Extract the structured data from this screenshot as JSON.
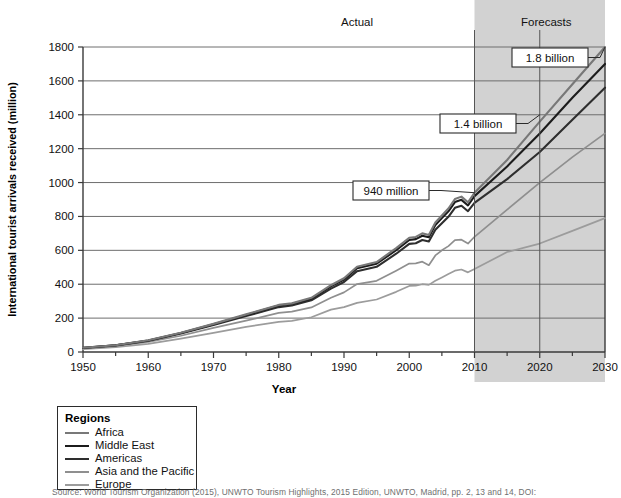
{
  "chart_data": {
    "type": "line",
    "title": "",
    "xlabel": "Year",
    "ylabel": "International tourist arrivals received (million)",
    "xlim": [
      1950,
      2030
    ],
    "ylim": [
      0,
      1800
    ],
    "grid": true,
    "legend_position": "below-left",
    "legend_title": "Regions",
    "x_ticks": [
      "1950",
      "1960",
      "1970",
      "1980",
      "1990",
      "2000",
      "2010",
      "2020",
      "2030"
    ],
    "x_tick_values": [
      1950,
      1960,
      1970,
      1980,
      1990,
      2000,
      2010,
      2020,
      2030
    ],
    "y_ticks": [
      "0",
      "200",
      "400",
      "600",
      "800",
      "1000",
      "1200",
      "1400",
      "1600",
      "1800"
    ],
    "y_tick_values": [
      0,
      200,
      400,
      600,
      800,
      1000,
      1200,
      1400,
      1600,
      1800
    ],
    "region_labels": [
      {
        "text": "Actual",
        "x": 1992,
        "note": "non-shaded historical area"
      },
      {
        "text": "Forecasts",
        "x": 2021,
        "note": "shaded projection area"
      }
    ],
    "forecast_shading": {
      "from": 2010,
      "to": 2030,
      "color": "#d2d2d2"
    },
    "annotations": [
      {
        "label": "940 million",
        "year": 2010,
        "value": 940,
        "box_x": 353,
        "box_y": 181
      },
      {
        "label": "1.4 billion",
        "year": 2020,
        "value": 1400,
        "box_x": 440,
        "box_y": 114
      },
      {
        "label": "1.8 billion",
        "year": 2030,
        "value": 1800,
        "box_x": 512,
        "box_y": 48
      }
    ],
    "x": [
      1950,
      1955,
      1960,
      1965,
      1970,
      1975,
      1980,
      1982,
      1985,
      1988,
      1990,
      1992,
      1995,
      1998,
      2000,
      2001,
      2002,
      2003,
      2004,
      2005,
      2006,
      2007,
      2008,
      2009,
      2010,
      2015,
      2020,
      2025,
      2030
    ],
    "series": [
      {
        "name": "Africa",
        "color": "#787878",
        "note": "topmost cumulative band; world total line",
        "values": [
          25,
          40,
          69,
          113,
          166,
          222,
          278,
          287,
          320,
          394,
          435,
          503,
          531,
          613,
          674,
          679,
          700,
          691,
          764,
          806,
          847,
          903,
          917,
          883,
          940,
          1133,
          1360,
          1580,
          1800
        ]
      },
      {
        "name": "Middle East",
        "color": "#1c1c1c",
        "note": "second cumulative band",
        "values": [
          25,
          40,
          68,
          112,
          164,
          219,
          274,
          283,
          315,
          387,
          427,
          494,
          521,
          601,
          661,
          666,
          686,
          677,
          749,
          790,
          830,
          885,
          898,
          865,
          920,
          1095,
          1290,
          1500,
          1700
        ]
      },
      {
        "name": "Americas",
        "color": "#2e2e2e",
        "note": "third cumulative band",
        "values": [
          24,
          39,
          66,
          109,
          159,
          212,
          265,
          274,
          305,
          374,
          413,
          477,
          503,
          580,
          638,
          642,
          661,
          652,
          721,
          760,
          798,
          851,
          863,
          831,
          880,
          1020,
          1180,
          1370,
          1560
        ],
        "values_alt": null
      },
      {
        "name": "Asia and the Pacific",
        "color": "#8f8f8f",
        "note": "fourth cumulative band, strong growth after 1990",
        "values": [
          22,
          35,
          60,
          96,
          142,
          185,
          231,
          238,
          263,
          320,
          352,
          401,
          420,
          480,
          522,
          523,
          533,
          512,
          570,
          600,
          625,
          660,
          663,
          640,
          680,
          840,
          1000,
          1150,
          1290
        ]
      },
      {
        "name": "Europe",
        "color": "#9c9c9c",
        "note": "lowest band, slowest projected growth",
        "values": [
          17,
          28,
          48,
          79,
          113,
          148,
          178,
          184,
          205,
          250,
          265,
          290,
          310,
          355,
          390,
          392,
          400,
          396,
          420,
          440,
          460,
          480,
          487,
          470,
          490,
          590,
          640,
          715,
          790
        ]
      }
    ]
  },
  "legend": {
    "title": "Regions",
    "items": [
      {
        "label": "Africa",
        "color": "#787878"
      },
      {
        "label": "Middle East",
        "color": "#1c1c1c"
      },
      {
        "label": "Americas",
        "color": "#2e2e2e"
      },
      {
        "label": "Asia and the Pacific",
        "color": "#8f8f8f"
      },
      {
        "label": "Europe",
        "color": "#9c9c9c"
      }
    ]
  },
  "source_note": "Source: World Tourism Organization (2015), UNWTO Tourism Highlights, 2015 Edition, UNWTO, Madrid, pp. 2, 13 and 14, DOI:"
}
